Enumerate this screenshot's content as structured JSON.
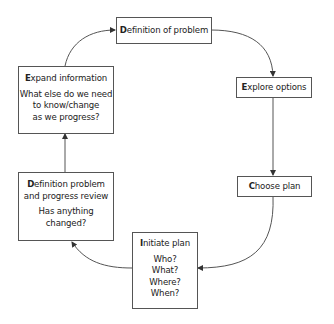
{
  "diagram": {
    "type": "cycle-flowchart",
    "nodes": [
      {
        "id": "definition",
        "initial": "D",
        "rest": "efinition of problem",
        "lines": []
      },
      {
        "id": "explore",
        "initial": "E",
        "rest": "xplore options",
        "lines": []
      },
      {
        "id": "choose",
        "initial": "C",
        "rest": "hoose plan",
        "lines": []
      },
      {
        "id": "initiate",
        "initial": "I",
        "rest": "nitiate plan",
        "lines": [
          "Who?",
          "What?",
          "Where?",
          "When?"
        ]
      },
      {
        "id": "review",
        "initial": "D",
        "rest": "efinition problem",
        "title_line2": "and progress review",
        "lines": [
          "Has anything",
          "changed?"
        ]
      },
      {
        "id": "expand",
        "initial": "E",
        "rest": "xpand information",
        "lines": [
          "What else do we need",
          "to know/change",
          "as we progress?"
        ]
      }
    ],
    "edges": [
      {
        "from": "definition",
        "to": "explore"
      },
      {
        "from": "explore",
        "to": "choose"
      },
      {
        "from": "choose",
        "to": "initiate"
      },
      {
        "from": "initiate",
        "to": "review"
      },
      {
        "from": "review",
        "to": "expand"
      },
      {
        "from": "expand",
        "to": "definition"
      }
    ],
    "colors": {
      "stroke": "#555555",
      "text": "#222222",
      "background": "#ffffff"
    }
  }
}
